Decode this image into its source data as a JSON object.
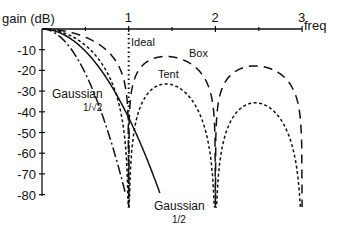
{
  "chart_data": {
    "type": "line",
    "title": "",
    "xlabel": "freq",
    "ylabel": "gain (dB)",
    "xlim": [
      0,
      3
    ],
    "ylim": [
      -80,
      0
    ],
    "x_ticks": [
      "1",
      "2",
      "3"
    ],
    "x_minor_ticks": [
      0.5,
      1.5,
      2.5
    ],
    "y_ticks": [
      "-10",
      "-20",
      "-30",
      "-40",
      "-50",
      "-60",
      "-70",
      "-80"
    ],
    "grid": false,
    "series": [
      {
        "name": "Ideal",
        "style": "dotted",
        "description": "vertical cutoff at freq = 1",
        "x": [
          1,
          1
        ],
        "values": [
          0,
          -80
        ]
      },
      {
        "name": "Box",
        "style": "long-dash",
        "formula": "20*log10(|sinc(f)|)",
        "sidelobe_peaks_db": [
          -13.3,
          -17.9
        ],
        "nulls": [
          1,
          2,
          3
        ]
      },
      {
        "name": "Tent",
        "style": "short-dash",
        "formula": "40*log10(|sinc(f)|)",
        "sidelobe_peaks_db": [
          -26.5,
          -35.8
        ],
        "nulls": [
          1,
          2,
          3
        ]
      },
      {
        "name": "Gaussian 1/√2",
        "style": "dash-dot",
        "sigma": 0.7071,
        "formula": "-8.686*2*pi^2*sigma^2*f^2"
      },
      {
        "name": "Gaussian 1/2",
        "style": "solid",
        "sigma": 0.5,
        "formula": "-8.686*2*pi^2*sigma^2*f^2"
      }
    ],
    "annotations": [
      {
        "text": "Ideal",
        "near": "freq 1, -5 dB"
      },
      {
        "text": "Box",
        "near": "freq 1.6, -13 dB"
      },
      {
        "text": "Tent",
        "near": "freq 1.4, -23 dB"
      },
      {
        "text": "Gaussian",
        "sub": "1/√2",
        "near": "freq 0.35, -30 dB"
      },
      {
        "text": "Gaussian",
        "sub": "1/2",
        "near": "freq 1.55, -78 dB"
      }
    ]
  },
  "labels": {
    "ylabel": "gain (dB)",
    "xlabel": "freq",
    "ideal": "Ideal",
    "box": "Box",
    "tent": "Tent",
    "gauss1": "Gaussian",
    "gauss1_sub": "1/√2",
    "gauss2": "Gaussian",
    "gauss2_sub": "1/2"
  }
}
